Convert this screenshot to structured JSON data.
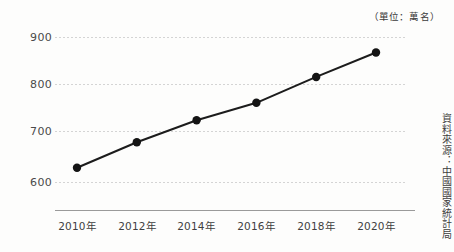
{
  "chart_data": {
    "type": "line",
    "title": "",
    "subtitle": "",
    "unit_caption": "（單位：萬名）",
    "source_note": "資料來源：中國國家統計局",
    "xlabel": "",
    "ylabel": "",
    "categories": [
      "2010年",
      "2012年",
      "2014年",
      "2016年",
      "2018年",
      "2020年"
    ],
    "x": [
      2010,
      2012,
      2014,
      2016,
      2018,
      2020
    ],
    "values": [
      628,
      678,
      723,
      760,
      815,
      867
    ],
    "series": [
      {
        "name": "",
        "values": [
          628,
          678,
          723,
          760,
          815,
          867
        ]
      }
    ],
    "ylim": [
      600,
      900
    ],
    "y_ticks": [
      600,
      700,
      800,
      900
    ],
    "y_tick_labels": [
      "600",
      "700",
      "800",
      "900"
    ],
    "grid": "horizontal-dotted",
    "legend": "none",
    "marker": "filled-circle",
    "line_color": "#1c1c1c",
    "marker_color": "#141414",
    "gridline_color": "#d2d2d2",
    "axis_color": "#9a9a9a",
    "background_color": "#fdfdfc"
  },
  "axes": {
    "y_ticks": [
      {
        "label": "900",
        "value": 900
      },
      {
        "label": "800",
        "value": 800
      },
      {
        "label": "700",
        "value": 700
      },
      {
        "label": "600",
        "value": 600
      }
    ],
    "x_ticks": [
      {
        "label": "2010年"
      },
      {
        "label": "2012年"
      },
      {
        "label": "2014年"
      },
      {
        "label": "2016年"
      },
      {
        "label": "2018年"
      },
      {
        "label": "2020年"
      }
    ]
  },
  "annotations": {
    "unit": "（單位：萬名）",
    "source": "資料來源：中國國家統計局"
  }
}
